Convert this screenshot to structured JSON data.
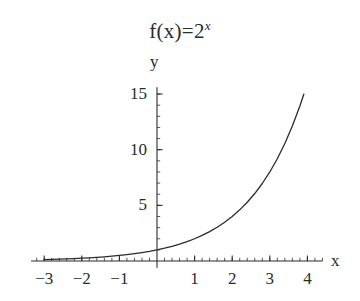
{
  "chart_data": {
    "type": "line",
    "title_base": "f(x)=2",
    "title_exponent": "x",
    "xlabel": "x",
    "ylabel": "y",
    "function": "y = 2^x",
    "xlim": [
      -3.35,
      4.4
    ],
    "ylim": [
      -0.6,
      15.6
    ],
    "grid": false,
    "legend": false,
    "x_ticks": [
      -3,
      -2,
      -1,
      1,
      2,
      3,
      4
    ],
    "x_tick_labels": [
      "−3",
      "−2",
      "−1",
      "1",
      "2",
      "3",
      "4"
    ],
    "x_minor_tick_step": 0.2,
    "y_ticks": [
      5,
      10,
      15
    ],
    "y_tick_labels": [
      "5",
      "10",
      "15"
    ],
    "y_minor_tick_step": 1,
    "line_color": "#2b2b2b",
    "axis_color": "#2b2b2b",
    "background_color": "#ffffff",
    "x": [
      -3,
      -2.8,
      -2.6,
      -2.4,
      -2.2,
      -2,
      -1.8,
      -1.6,
      -1.4,
      -1.2,
      -1,
      -0.8,
      -0.6,
      -0.4,
      -0.2,
      0,
      0.2,
      0.4,
      0.6,
      0.8,
      1,
      1.2,
      1.4,
      1.6,
      1.8,
      2,
      2.2,
      2.4,
      2.6,
      2.8,
      3,
      3.2,
      3.4,
      3.6,
      3.8,
      3.9069
    ],
    "values": [
      0.125,
      0.1436,
      0.1649,
      0.1895,
      0.2176,
      0.25,
      0.2872,
      0.3299,
      0.3789,
      0.4353,
      0.5,
      0.5743,
      0.6598,
      0.7579,
      0.8706,
      1,
      1.1487,
      1.3195,
      1.5157,
      1.7411,
      2,
      2.2974,
      2.639,
      3.0314,
      3.4822,
      4,
      4.5948,
      5.278,
      6.0629,
      6.9644,
      8,
      9.1896,
      10.556,
      12.126,
      13.929,
      15
    ]
  }
}
